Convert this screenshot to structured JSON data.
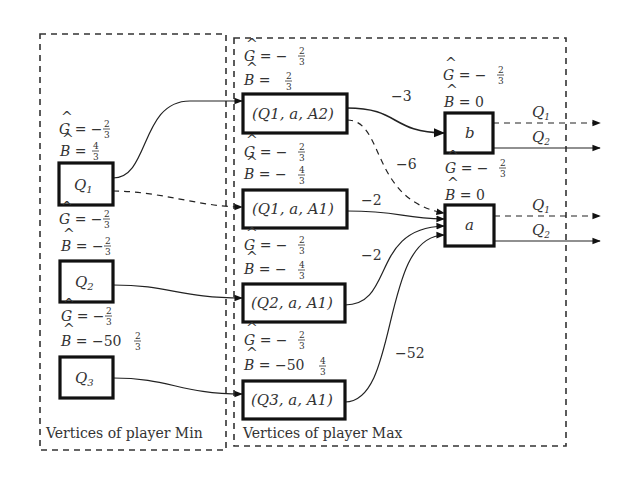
{
  "frames": {
    "min": {
      "title": "Vertices of player Min"
    },
    "max": {
      "title": "Vertices of player Max"
    }
  },
  "min_vertices": [
    {
      "id": "Q1",
      "label": "Q",
      "sub": "1",
      "G": {
        "sign": "−",
        "int": "",
        "num": "2",
        "den": "3"
      },
      "B": {
        "sign": "",
        "int": "",
        "num": "4",
        "den": "3"
      }
    },
    {
      "id": "Q2",
      "label": "Q",
      "sub": "2",
      "G": {
        "sign": "−",
        "int": "",
        "num": "2",
        "den": "3"
      },
      "B": {
        "sign": "−",
        "int": "",
        "num": "2",
        "den": "3"
      }
    },
    {
      "id": "Q3",
      "label": "Q",
      "sub": "3",
      "G": {
        "sign": "−",
        "int": "",
        "num": "2",
        "den": "3"
      },
      "B": {
        "sign": "−",
        "int": "50",
        "num": "2",
        "den": "3"
      }
    }
  ],
  "max_vertices": [
    {
      "id": "Q1aA2",
      "label": "(Q1, a, A2)",
      "G": {
        "sign": "−",
        "int": "",
        "num": "2",
        "den": "3"
      },
      "B": {
        "sign": "",
        "int": "",
        "num": "2",
        "den": "3"
      }
    },
    {
      "id": "Q1aA1",
      "label": "(Q1, a, A1)",
      "G": {
        "sign": "−",
        "int": "",
        "num": "2",
        "den": "3"
      },
      "B": {
        "sign": "−",
        "int": "",
        "num": "4",
        "den": "3"
      }
    },
    {
      "id": "Q2aA1",
      "label": "(Q2, a, A1)",
      "G": {
        "sign": "−",
        "int": "",
        "num": "2",
        "den": "3"
      },
      "B": {
        "sign": "−",
        "int": "",
        "num": "4",
        "den": "3"
      }
    },
    {
      "id": "Q3aA1",
      "label": "(Q3, a, A1)",
      "G": {
        "sign": "−",
        "int": "",
        "num": "2",
        "den": "3"
      },
      "B": {
        "sign": "−",
        "int": "50",
        "num": "4",
        "den": "3"
      }
    }
  ],
  "letter_vertices": [
    {
      "id": "b",
      "label": "b",
      "G": {
        "sign": "−",
        "num": "2",
        "den": "3"
      },
      "B": "0"
    },
    {
      "id": "a",
      "label": "a",
      "G": {
        "sign": "−",
        "num": "2",
        "den": "3"
      },
      "B": "0"
    }
  ],
  "edges": [
    {
      "from": "Q1",
      "to": "Q1aA2",
      "style": "solid",
      "weight": ""
    },
    {
      "from": "Q1",
      "to": "Q1aA1",
      "style": "dashed",
      "weight": ""
    },
    {
      "from": "Q2",
      "to": "Q2aA1",
      "style": "solid",
      "weight": ""
    },
    {
      "from": "Q3",
      "to": "Q3aA1",
      "style": "solid",
      "weight": ""
    },
    {
      "from": "Q1aA2",
      "to": "b",
      "style": "solid",
      "weight": "−3"
    },
    {
      "from": "Q1aA2",
      "to": "a",
      "style": "dashed",
      "weight": "−6"
    },
    {
      "from": "Q1aA1",
      "to": "a",
      "style": "solid",
      "weight": "−2"
    },
    {
      "from": "Q2aA1",
      "to": "a",
      "style": "solid",
      "weight": "−2"
    },
    {
      "from": "Q3aA1",
      "to": "a",
      "style": "solid",
      "weight": "−52"
    },
    {
      "from": "b",
      "to": "out",
      "style": "dashed",
      "weight": "Q1"
    },
    {
      "from": "b",
      "to": "out",
      "style": "solid",
      "weight": "Q2"
    },
    {
      "from": "a",
      "to": "out",
      "style": "dashed",
      "weight": "Q1"
    },
    {
      "from": "a",
      "to": "out",
      "style": "solid",
      "weight": "Q2"
    }
  ],
  "symbols": {
    "G": "G",
    "B": "B",
    "hat": "^",
    "eq": "="
  }
}
